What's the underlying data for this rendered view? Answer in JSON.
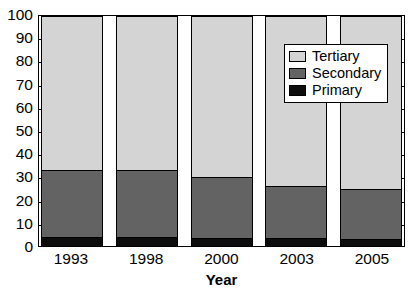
{
  "chart_data": {
    "type": "bar",
    "subtype": "stacked-bar-100-percent",
    "title": "",
    "xlabel": "Year",
    "ylabel": "",
    "categories": [
      "1993",
      "1998",
      "2000",
      "2003",
      "2005"
    ],
    "series": [
      {
        "name": "Primary",
        "color": "#0d0d0d",
        "values": [
          4,
          4,
          3.5,
          3.5,
          3
        ]
      },
      {
        "name": "Secondary",
        "color": "#636363",
        "values": [
          29,
          29,
          26.5,
          22.5,
          22
        ]
      },
      {
        "name": "Tertiary",
        "color": "#d4d4d4",
        "values": [
          67,
          67,
          70,
          74,
          75
        ]
      }
    ],
    "cumulative_tops": {
      "Primary": [
        4,
        4,
        3.5,
        3.5,
        3
      ],
      "Secondary": [
        33,
        33,
        30,
        26,
        25
      ],
      "Tertiary": [
        100,
        100,
        100,
        100,
        100
      ]
    },
    "ylim": [
      0,
      100
    ],
    "ytick_labels": [
      "100",
      "90",
      "80",
      "70",
      "60",
      "50",
      "40",
      "30",
      "20",
      "10",
      "0"
    ],
    "ytick_values": [
      100,
      90,
      80,
      70,
      60,
      50,
      40,
      30,
      20,
      10,
      0
    ],
    "grid": false,
    "ticks_inward": true,
    "legend": {
      "position": "top-right-inside",
      "entries": [
        {
          "label": "Tertiary",
          "color": "#d4d4d4"
        },
        {
          "label": "Secondary",
          "color": "#636363"
        },
        {
          "label": "Primary",
          "color": "#0d0d0d"
        }
      ]
    }
  }
}
